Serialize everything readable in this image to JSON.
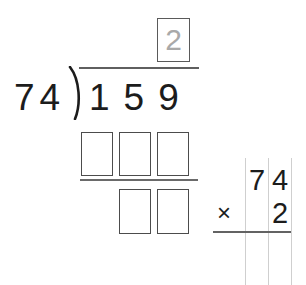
{
  "problem": {
    "type": "long-division",
    "divisor": "74",
    "dividend": "159",
    "quotient_hint": "2",
    "quotient_hint_color": "#a9a9a9",
    "ink_color": "#1c1c1c",
    "rule_color": "#5f5f5f",
    "box_border_color": "#4c4c4c",
    "guide_line_color": "#cfcfcf",
    "background": "#ffffff"
  },
  "division": {
    "divisor_label": "74",
    "dividend_label": "159",
    "bracket_icon": "division-bracket-icon",
    "quotient_boxes": [
      {
        "value": "2",
        "filled": false,
        "is_hint": true
      }
    ],
    "product_boxes": [
      {
        "value": "",
        "filled": false
      },
      {
        "value": "",
        "filled": false
      },
      {
        "value": "",
        "filled": false
      }
    ],
    "remainder_boxes": [
      {
        "value": "",
        "filled": false
      },
      {
        "value": "",
        "filled": false
      }
    ]
  },
  "multiplication": {
    "operator": "×",
    "top_digits": [
      "7",
      "4"
    ],
    "bottom_digits": [
      "2"
    ],
    "column_count": 3
  }
}
